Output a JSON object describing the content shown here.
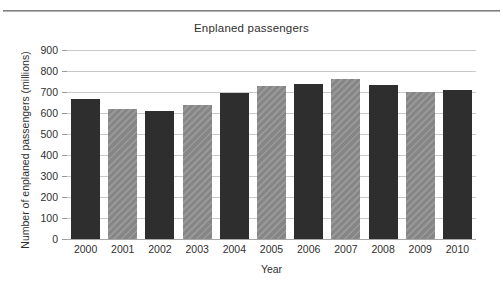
{
  "chart_data": {
    "type": "bar",
    "title": "Enplaned passengers",
    "xlabel": "Year",
    "ylabel": "Number of enplaned passengers (millions)",
    "categories": [
      "2000",
      "2001",
      "2002",
      "2003",
      "2004",
      "2005",
      "2006",
      "2007",
      "2008",
      "2009",
      "2010"
    ],
    "values": [
      665,
      617,
      608,
      640,
      697,
      730,
      737,
      763,
      733,
      700,
      710
    ],
    "ylim": [
      0,
      900
    ],
    "ytick_labels": [
      "900",
      "800",
      "700",
      "600",
      "500",
      "400",
      "300",
      "200",
      "100",
      "0"
    ],
    "ytick_values": [
      900,
      800,
      700,
      600,
      500,
      400,
      300,
      200,
      100,
      0
    ],
    "ytick_step": 100,
    "grid": true,
    "legend": "none",
    "bar_styles": [
      "dark",
      "gray",
      "dark",
      "gray",
      "dark",
      "gray",
      "dark",
      "gray",
      "dark",
      "gray",
      "dark"
    ],
    "colors": {
      "dark_bar": "#2e2e2e",
      "gray_bar": "#8c8c8c",
      "gridline": "#c9c9c9",
      "axis": "#a8a8a8",
      "text": "#2f2f2f",
      "background": "#ffffff"
    }
  }
}
